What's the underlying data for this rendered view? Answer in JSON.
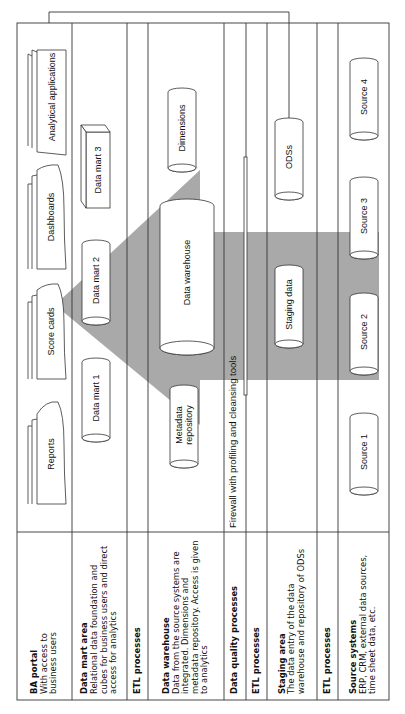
{
  "diagram": {
    "orientation": "rotated -90deg",
    "colors": {
      "line": "#333333",
      "shade": "#a9a9a9",
      "background": "#ffffff"
    }
  },
  "lanes": [
    {
      "id": "ba-portal",
      "title": "BA portal",
      "desc": "With access to business users"
    },
    {
      "id": "data-mart-area",
      "title": "Data mart area",
      "desc": "Relational data foundation and cubes for business users and direct access for analytics"
    },
    {
      "id": "etl-1",
      "title": "ETL processes",
      "desc": ""
    },
    {
      "id": "data-warehouse",
      "title": "Data warehouse",
      "desc": "Data from the source systems are integrated. Dimensions and metadata repository. Access is given to analytics"
    },
    {
      "id": "data-quality",
      "title": "Data quality processes",
      "desc": ""
    },
    {
      "id": "etl-2",
      "title": "ETL processes",
      "desc": ""
    },
    {
      "id": "staging-area",
      "title": "Staging area",
      "desc": "The data entry of the data warehouse and repository of ODSs"
    },
    {
      "id": "etl-3",
      "title": "ETL processes",
      "desc": ""
    },
    {
      "id": "source-systems",
      "title": "Source systems",
      "desc": "ERP, CRM, external data sources, time sheet data, etc."
    }
  ],
  "portal_items": [
    "Reports",
    "Score cards",
    "Dashboards",
    "Analytical applications"
  ],
  "data_marts": [
    "Data mart 1",
    "Data mart 2",
    "Data mart 3"
  ],
  "warehouse": {
    "metadata": "Metadata repository",
    "main": "Data warehouse",
    "dimensions": "Dimensions"
  },
  "firewall": {
    "label": "Firewall with profiling and cleansing tools"
  },
  "staging": {
    "staging_data": "Staging data",
    "ods": "ODSs"
  },
  "sources": [
    "Source 1",
    "Source 2",
    "Source 3",
    "Source 4"
  ]
}
